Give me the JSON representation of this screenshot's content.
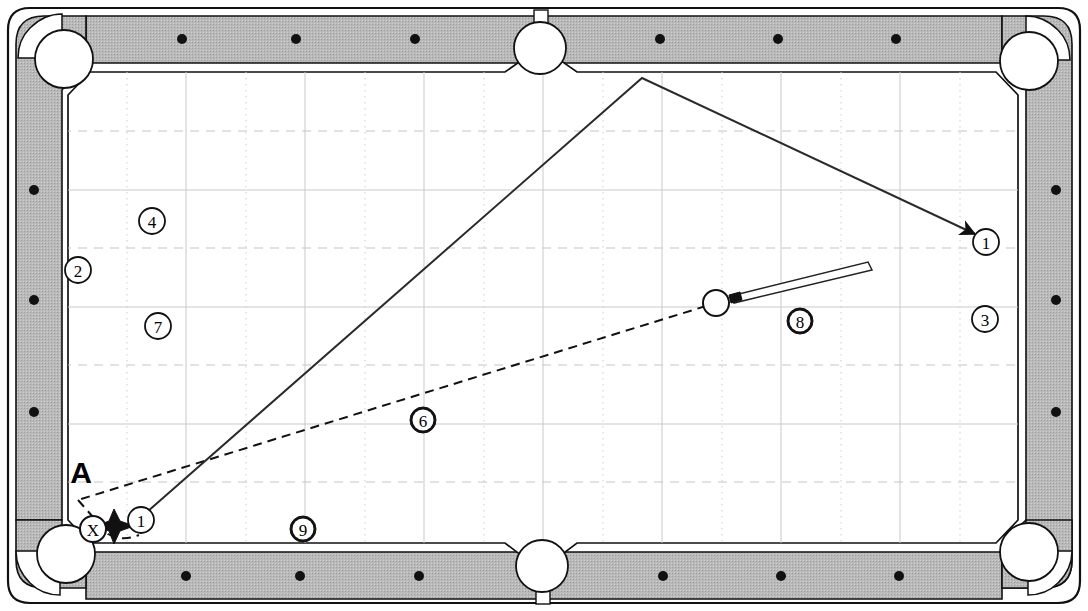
{
  "diagram": {
    "type": "billiards-table-shot-diagram",
    "table": {
      "outer_frame_color": "#ffffff",
      "rail_fill_color": "#b8b8b8",
      "cloth_color": "#ffffff",
      "line_color": "#1a1a1a",
      "grid_major_color": "#c9c9c9",
      "grid_minor_color": "#d8d8d8"
    },
    "labels": {
      "position_a": "A",
      "cue_ball_mark": "X"
    },
    "balls": [
      {
        "id": "ball-2",
        "number": "2",
        "x": 78,
        "y": 270,
        "style": "single",
        "radius": 13
      },
      {
        "id": "ball-4",
        "number": "4",
        "x": 152,
        "y": 221,
        "style": "single",
        "radius": 13
      },
      {
        "id": "ball-7",
        "number": "7",
        "x": 158,
        "y": 326,
        "style": "single",
        "radius": 13
      },
      {
        "id": "ball-6",
        "number": "6",
        "x": 423,
        "y": 420,
        "style": "double",
        "radius": 13
      },
      {
        "id": "ball-9",
        "number": "9",
        "x": 303,
        "y": 529,
        "style": "double",
        "radius": 13
      },
      {
        "id": "ball-8",
        "number": "8",
        "x": 800,
        "y": 321,
        "style": "double",
        "radius": 13
      },
      {
        "id": "ball-3",
        "number": "3",
        "x": 985,
        "y": 319,
        "style": "single",
        "radius": 13
      },
      {
        "id": "ball-1-target",
        "number": "1",
        "x": 986,
        "y": 242,
        "style": "single",
        "radius": 13
      },
      {
        "id": "ball-1-object",
        "number": "1",
        "x": 141,
        "y": 520,
        "style": "single",
        "radius": 13
      },
      {
        "id": "ball-x-cue-position",
        "number": "X",
        "x": 93,
        "y": 529,
        "style": "single",
        "radius": 13
      }
    ],
    "cue_ball": {
      "x": 716,
      "y": 303,
      "radius": 13
    },
    "cue_stick": {
      "tip_x": 730,
      "tip_y": 296,
      "butt_x": 866,
      "butt_y": 263
    },
    "solid_path": [
      {
        "x": 141,
        "y": 520
      },
      {
        "x": 642,
        "y": 78
      },
      {
        "x": 986,
        "y": 239
      }
    ],
    "dashed_path": [
      {
        "x": 716,
        "y": 303
      },
      {
        "x": 78,
        "y": 500
      },
      {
        "x": 110,
        "y": 532
      }
    ],
    "impact_burst": {
      "x": 114,
      "y": 526
    },
    "arrow_head": {
      "x": 986,
      "y": 239
    },
    "rail_diamonds": {
      "top": [
        182,
        296,
        415,
        660,
        778,
        896
      ],
      "bottom": [
        186,
        300,
        419,
        663,
        781,
        899
      ],
      "left": [
        34,
        190,
        300,
        412
      ],
      "right": [
        1056,
        190,
        300,
        412
      ]
    },
    "pockets": [
      {
        "id": "pocket-top-left",
        "x": 64,
        "y": 59,
        "r": 29
      },
      {
        "id": "pocket-top-side",
        "x": 540,
        "y": 48,
        "r": 25
      },
      {
        "id": "pocket-top-right",
        "x": 1029,
        "y": 61,
        "r": 29
      },
      {
        "id": "pocket-bottom-left",
        "x": 66,
        "y": 554,
        "r": 29
      },
      {
        "id": "pocket-bottom-side",
        "x": 542,
        "y": 566,
        "r": 25
      },
      {
        "id": "pocket-bottom-right",
        "x": 1029,
        "y": 552,
        "r": 29
      }
    ]
  }
}
